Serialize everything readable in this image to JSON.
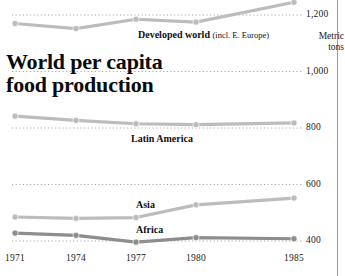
{
  "headline": "World per capita\nfood production",
  "unit_caption": "Metric\ntons",
  "colors": {
    "light_series": "#bcbcbc",
    "dark_series": "#8d8d8d",
    "gridline": "#a9a9a9",
    "text": "#111111",
    "column_rule": "#9a9a9a"
  },
  "labels": {
    "developed_world": "Developed world",
    "developed_world_note": "(incl. E. Europe)",
    "latin_america": "Latin America",
    "asia": "Asia",
    "africa": "Africa"
  },
  "chart_data": {
    "type": "line",
    "title": "World per capita food production",
    "xlabel": "",
    "ylabel": "Metric tons",
    "ylim": [
      370,
      1275
    ],
    "yticks": [
      400,
      600,
      800,
      1000,
      1200
    ],
    "ytick_labels": [
      "400",
      "600",
      "800",
      "1,000",
      "1,200"
    ],
    "grid": true,
    "grid_style": "dotted",
    "legend": "inline-annotations",
    "x": [
      1971,
      1974,
      1977,
      1980,
      1985
    ],
    "xtick_labels": [
      "1971",
      "1974",
      "1977",
      "1980",
      "1985"
    ],
    "series": [
      {
        "name": "Developed world (incl. E. Europe)",
        "color": "#bcbcbc",
        "values": [
          1170,
          1152,
          1185,
          1175,
          1245
        ]
      },
      {
        "name": "Latin America",
        "color": "#bcbcbc",
        "values": [
          842,
          827,
          815,
          812,
          818
        ]
      },
      {
        "name": "Asia",
        "color": "#bcbcbc",
        "values": [
          485,
          480,
          483,
          528,
          552
        ]
      },
      {
        "name": "Africa",
        "color": "#8d8d8d",
        "values": [
          428,
          420,
          396,
          412,
          408
        ]
      }
    ]
  }
}
